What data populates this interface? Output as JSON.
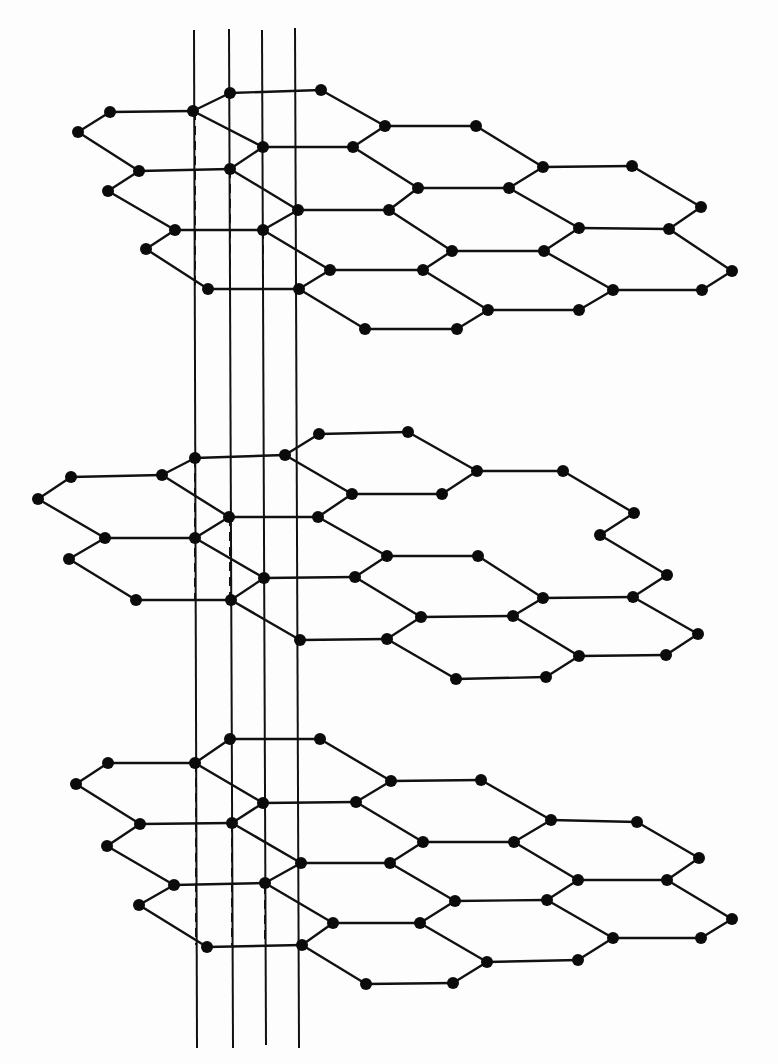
{
  "diagram": {
    "title": "",
    "stroke_color": "#111111",
    "atom_color": "#0b0b0b",
    "background": "#fdfdfd",
    "atom_radius": 6,
    "bond_vectors": [
      [
        91,
        0
      ],
      [
        35,
        -19
      ],
      [
        68,
        36
      ]
    ],
    "vertical_lines": [
      {
        "x1": 194,
        "y1": 30,
        "x2": 197,
        "y2": 1048
      },
      {
        "x1": 229,
        "y1": 29,
        "x2": 233,
        "y2": 1048
      },
      {
        "x1": 262,
        "y1": 30,
        "x2": 266,
        "y2": 1045
      },
      {
        "x1": 295,
        "y1": 28,
        "x2": 299,
        "y2": 1048
      }
    ],
    "layers": [
      {
        "name": "top-layer",
        "atoms": [
          [
            78,
            132
          ],
          [
            110,
            112
          ],
          [
            193,
            111
          ],
          [
            230,
            93
          ],
          [
            321,
            90
          ],
          [
            385,
            126
          ],
          [
            476,
            126
          ],
          [
            263,
            147
          ],
          [
            353,
            147
          ],
          [
            139,
            171
          ],
          [
            230,
            169
          ],
          [
            543,
            167
          ],
          [
            632,
            166
          ],
          [
            418,
            188
          ],
          [
            509,
            188
          ],
          [
            108,
            191
          ],
          [
            298,
            210
          ],
          [
            389,
            210
          ],
          [
            701,
            207
          ],
          [
            175,
            230
          ],
          [
            263,
            230
          ],
          [
            579,
            228
          ],
          [
            669,
            229
          ],
          [
            146,
            249
          ],
          [
            452,
            251
          ],
          [
            544,
            251
          ],
          [
            330,
            270
          ],
          [
            423,
            270
          ],
          [
            732,
            271
          ],
          [
            208,
            289
          ],
          [
            299,
            289
          ],
          [
            613,
            290
          ],
          [
            702,
            290
          ],
          [
            488,
            310
          ],
          [
            579,
            310
          ],
          [
            365,
            329
          ],
          [
            457,
            329
          ]
        ],
        "dashes": [
          [
            195,
            111,
            195,
            289
          ],
          [
            230,
            169,
            230,
            289
          ],
          [
            263,
            230,
            263,
            289
          ]
        ]
      },
      {
        "name": "middle-layer",
        "atoms": [
          [
            38,
            499
          ],
          [
            71,
            477
          ],
          [
            162,
            475
          ],
          [
            195,
            458
          ],
          [
            285,
            455
          ],
          [
            319,
            434
          ],
          [
            408,
            432
          ],
          [
            352,
            494
          ],
          [
            442,
            494
          ],
          [
            105,
            538
          ],
          [
            195,
            538
          ],
          [
            229,
            517
          ],
          [
            318,
            517
          ],
          [
            477,
            471
          ],
          [
            563,
            471
          ],
          [
            634,
            513
          ],
          [
            69,
            559
          ],
          [
            387,
            556
          ],
          [
            478,
            556
          ],
          [
            600,
            535
          ],
          [
            264,
            578
          ],
          [
            355,
            577
          ],
          [
            543,
            598
          ],
          [
            633,
            597
          ],
          [
            667,
            575
          ],
          [
            136,
            600
          ],
          [
            231,
            600
          ],
          [
            421,
            617
          ],
          [
            513,
            616
          ],
          [
            300,
            640
          ],
          [
            387,
            639
          ],
          [
            579,
            656
          ],
          [
            666,
            655
          ],
          [
            698,
            634
          ],
          [
            456,
            679
          ],
          [
            546,
            677
          ]
        ],
        "dashes": [
          [
            195,
            458,
            195,
            600
          ],
          [
            230,
            517,
            230,
            600
          ]
        ]
      },
      {
        "name": "bottom-layer",
        "atoms": [
          [
            76,
            784
          ],
          [
            108,
            763
          ],
          [
            195,
            763
          ],
          [
            230,
            739
          ],
          [
            320,
            739
          ],
          [
            391,
            781
          ],
          [
            481,
            780
          ],
          [
            263,
            803
          ],
          [
            356,
            802
          ],
          [
            140,
            824
          ],
          [
            232,
            823
          ],
          [
            551,
            820
          ],
          [
            637,
            822
          ],
          [
            423,
            842
          ],
          [
            514,
            842
          ],
          [
            107,
            846
          ],
          [
            301,
            863
          ],
          [
            390,
            863
          ],
          [
            699,
            858
          ],
          [
            174,
            885
          ],
          [
            265,
            883
          ],
          [
            578,
            880
          ],
          [
            667,
            880
          ],
          [
            139,
            905
          ],
          [
            455,
            901
          ],
          [
            547,
            900
          ],
          [
            333,
            923
          ],
          [
            420,
            923
          ],
          [
            732,
            919
          ],
          [
            207,
            947
          ],
          [
            302,
            945
          ],
          [
            613,
            938
          ],
          [
            701,
            938
          ],
          [
            487,
            962
          ],
          [
            578,
            960
          ],
          [
            366,
            984
          ],
          [
            453,
            983
          ]
        ],
        "dashes": [
          [
            196,
            763,
            196,
            945
          ],
          [
            232,
            823,
            232,
            945
          ],
          [
            265,
            885,
            265,
            945
          ]
        ]
      }
    ]
  }
}
